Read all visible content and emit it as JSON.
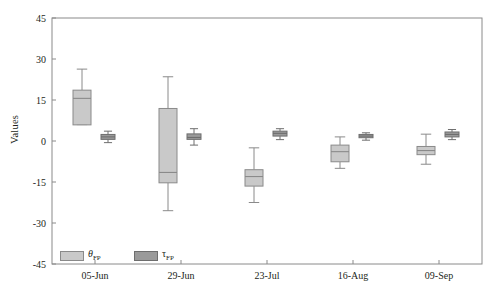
{
  "chart_data": {
    "type": "box",
    "title": "",
    "xlabel": "",
    "ylabel": "Values",
    "categories": [
      "05-Jun",
      "29-Jun",
      "23-Jul",
      "16-Aug",
      "09-Sep"
    ],
    "ylim": [
      -45,
      45
    ],
    "yticks": [
      45,
      30,
      15,
      0,
      -15,
      -30,
      -45
    ],
    "ytick_labels": [
      "45",
      "30",
      "15",
      "0",
      "-15",
      "-30",
      "-45"
    ],
    "grid": false,
    "legend_position": "bottom-left",
    "series": [
      {
        "name": "θFP",
        "legend_label_main": "θ",
        "legend_label_sub": "FP",
        "color": "#c9c9c9",
        "edge_color": "#8a8a8a",
        "boxes": [
          {
            "category": "05-Jun",
            "whisker_low": 6.0,
            "q1": 5.9,
            "median": 15.6,
            "q3": 18.6,
            "whisker_high": 26.3
          },
          {
            "category": "29-Jun",
            "whisker_low": -25.5,
            "q1": -15.3,
            "median": -11.5,
            "q3": 11.9,
            "whisker_high": 23.5
          },
          {
            "category": "23-Jul",
            "whisker_low": -22.5,
            "q1": -16.5,
            "median": -13.0,
            "q3": -10.5,
            "whisker_high": -2.5
          },
          {
            "category": "16-Aug",
            "whisker_low": -10.0,
            "q1": -7.6,
            "median": -3.9,
            "q3": -1.5,
            "whisker_high": 1.5
          },
          {
            "category": "09-Sep",
            "whisker_low": -8.5,
            "q1": -5.0,
            "median": -3.5,
            "q3": -2.0,
            "whisker_high": 2.5
          }
        ]
      },
      {
        "name": "τFP",
        "legend_label_main": "τ",
        "legend_label_sub": "FP",
        "color": "#9a9a9a",
        "edge_color": "#6e6e6e",
        "boxes": [
          {
            "category": "05-Jun",
            "whisker_low": -0.6,
            "q1": 0.6,
            "median": 1.5,
            "q3": 2.4,
            "whisker_high": 3.6
          },
          {
            "category": "29-Jun",
            "whisker_low": -1.5,
            "q1": 0.6,
            "median": 1.3,
            "q3": 2.6,
            "whisker_high": 4.5
          },
          {
            "category": "23-Jul",
            "whisker_low": 0.5,
            "q1": 1.8,
            "median": 2.8,
            "q3": 3.6,
            "whisker_high": 4.5
          },
          {
            "category": "16-Aug",
            "whisker_low": 0.3,
            "q1": 1.2,
            "median": 1.8,
            "q3": 2.4,
            "whisker_high": 3.0
          },
          {
            "category": "09-Sep",
            "whisker_low": 0.5,
            "q1": 1.5,
            "median": 2.4,
            "q3": 3.3,
            "whisker_high": 4.2
          }
        ]
      }
    ],
    "axis_color": "#8a8a8a",
    "background": "#ffffff"
  }
}
